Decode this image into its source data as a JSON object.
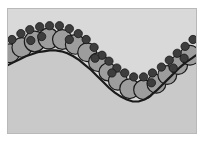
{
  "figure": {
    "title": "",
    "caption": "",
    "width": 208,
    "height": 142
  },
  "panel": {
    "name": "diagram-panel",
    "background_color": "#d9d9d9",
    "border_color": "#b9b9b9",
    "x": 7,
    "y": 8,
    "width": 190,
    "height": 126
  },
  "chart_data": {
    "type": "scatter",
    "title": "",
    "subtitle": "",
    "xlabel": "",
    "ylabel": "",
    "grid": false,
    "legend": "none",
    "xlim": [
      0,
      190
    ],
    "ylim": [
      0,
      126
    ],
    "series": [
      {
        "name": "interface-curve",
        "type": "line",
        "color": "#1a1a1a",
        "line_width": 2.2,
        "fill_below": "#c9c9c9",
        "points": [
          [
            0,
            57
          ],
          [
            6,
            54
          ],
          [
            12,
            51
          ],
          [
            18,
            48
          ],
          [
            24,
            46
          ],
          [
            30,
            44
          ],
          [
            36,
            43
          ],
          [
            42,
            42
          ],
          [
            48,
            42
          ],
          [
            54,
            43
          ],
          [
            60,
            45
          ],
          [
            66,
            48
          ],
          [
            72,
            52
          ],
          [
            78,
            57
          ],
          [
            84,
            62
          ],
          [
            90,
            68
          ],
          [
            96,
            74
          ],
          [
            102,
            80
          ],
          [
            108,
            85
          ],
          [
            114,
            89
          ],
          [
            120,
            92
          ],
          [
            126,
            94
          ],
          [
            132,
            94
          ],
          [
            138,
            92
          ],
          [
            144,
            88
          ],
          [
            150,
            83
          ],
          [
            156,
            77
          ],
          [
            162,
            71
          ],
          [
            168,
            65
          ],
          [
            174,
            59
          ],
          [
            180,
            54
          ],
          [
            186,
            50
          ],
          [
            190,
            47
          ]
        ]
      },
      {
        "name": "large-spheres",
        "type": "scatter",
        "fill_color": "#9d9d9d",
        "edge_color": "#1a1a1a",
        "edge_width": 1.2,
        "marker": "circle",
        "points": [
          {
            "x": 2,
            "y": 45,
            "r": 9.5
          },
          {
            "x": 14,
            "y": 39,
            "r": 10.0
          },
          {
            "x": 27,
            "y": 33,
            "r": 10.5
          },
          {
            "x": 41,
            "y": 30,
            "r": 10.5
          },
          {
            "x": 55,
            "y": 31,
            "r": 10.0
          },
          {
            "x": 68,
            "y": 36,
            "r": 10.0
          },
          {
            "x": 80,
            "y": 44,
            "r": 9.5
          },
          {
            "x": 91,
            "y": 54,
            "r": 9.5
          },
          {
            "x": 101,
            "y": 64,
            "r": 9.0
          },
          {
            "x": 111,
            "y": 73,
            "r": 9.5
          },
          {
            "x": 123,
            "y": 81,
            "r": 10.0
          },
          {
            "x": 137,
            "y": 82,
            "r": 10.0
          },
          {
            "x": 150,
            "y": 76,
            "r": 9.5
          },
          {
            "x": 161,
            "y": 67,
            "r": 9.5
          },
          {
            "x": 172,
            "y": 57,
            "r": 9.5
          },
          {
            "x": 184,
            "y": 47,
            "r": 10.0
          }
        ]
      },
      {
        "name": "small-spheres",
        "type": "scatter",
        "fill_color": "#3d3d3d",
        "edge_color": "#1a1a1a",
        "edge_width": 0.8,
        "marker": "circle",
        "points": [
          {
            "x": 4,
            "y": 31,
            "r": 4.2
          },
          {
            "x": 13,
            "y": 25,
            "r": 4.2
          },
          {
            "x": 22,
            "y": 21,
            "r": 4.2
          },
          {
            "x": 32,
            "y": 18,
            "r": 4.2
          },
          {
            "x": 42,
            "y": 17,
            "r": 4.2
          },
          {
            "x": 52,
            "y": 17,
            "r": 4.2
          },
          {
            "x": 62,
            "y": 20,
            "r": 4.2
          },
          {
            "x": 71,
            "y": 25,
            "r": 4.2
          },
          {
            "x": 79,
            "y": 31,
            "r": 4.2
          },
          {
            "x": 87,
            "y": 39,
            "r": 4.2
          },
          {
            "x": 95,
            "y": 47,
            "r": 4.2
          },
          {
            "x": 102,
            "y": 53,
            "r": 4.2
          },
          {
            "x": 110,
            "y": 60,
            "r": 4.2
          },
          {
            "x": 118,
            "y": 65,
            "r": 4.2
          },
          {
            "x": 127,
            "y": 69,
            "r": 4.2
          },
          {
            "x": 137,
            "y": 69,
            "r": 4.2
          },
          {
            "x": 146,
            "y": 65,
            "r": 4.2
          },
          {
            "x": 155,
            "y": 59,
            "r": 4.2
          },
          {
            "x": 163,
            "y": 52,
            "r": 4.2
          },
          {
            "x": 171,
            "y": 45,
            "r": 4.2
          },
          {
            "x": 179,
            "y": 38,
            "r": 4.2
          },
          {
            "x": 187,
            "y": 31,
            "r": 4.2
          },
          {
            "x": 23,
            "y": 32,
            "r": 4.2
          },
          {
            "x": 34,
            "y": 28,
            "r": 4.2
          },
          {
            "x": 62,
            "y": 31,
            "r": 4.2
          },
          {
            "x": 88,
            "y": 50,
            "r": 4.2
          },
          {
            "x": 105,
            "y": 65,
            "r": 4.2
          },
          {
            "x": 145,
            "y": 75,
            "r": 4.2
          },
          {
            "x": 167,
            "y": 60,
            "r": 4.2
          },
          {
            "x": 178,
            "y": 50,
            "r": 4.2
          }
        ]
      }
    ]
  }
}
